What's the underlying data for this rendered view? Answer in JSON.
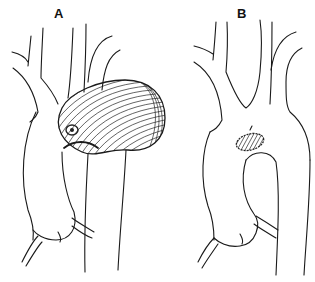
{
  "figure": {
    "panels": [
      {
        "label": "A",
        "content": "saccular-aneurysm"
      },
      {
        "label": "B",
        "content": "patch-repair"
      }
    ],
    "colors": {
      "line": "#1a1a1a",
      "background": "#ffffff"
    }
  }
}
